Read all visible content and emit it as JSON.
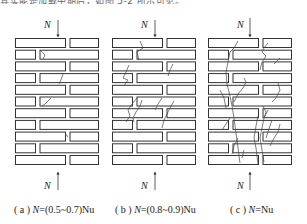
{
  "header": {
    "clipped_text": "其实能是加载中期后，如图 5-2 所示可见。"
  },
  "panels": [
    {
      "id": "a",
      "load_label": "N",
      "caption_prefix": "( a ) ",
      "caption_var": "N",
      "caption_rest": "=(0.5~0.7)Nu"
    },
    {
      "id": "b",
      "load_label": "N",
      "caption_prefix": "( b ) ",
      "caption_var": "N",
      "caption_rest": "=(0.8~0.9)Nu"
    },
    {
      "id": "c",
      "load_label": "N",
      "caption_prefix": "( c ) ",
      "caption_var": "N",
      "caption_rest": "=Nu"
    }
  ],
  "colors": {
    "line": "#333333",
    "crack": "#444444",
    "text": "#222222",
    "background": "#ffffff"
  }
}
